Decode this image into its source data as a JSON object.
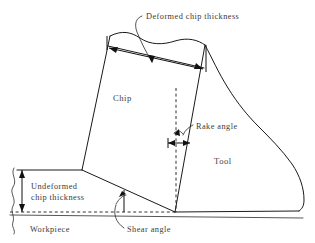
{
  "figure": {
    "kind": "technical-line-diagram",
    "background_color": "#ffffff",
    "line_color": "#1a1a1a",
    "text_color": "#3a3a3a"
  },
  "labels": {
    "deformed_chip_thickness": "Deformed chip thickness",
    "chip": "Chip",
    "rake_angle": "Rake angle",
    "tool": "Tool",
    "undeformed_chip_thickness_line1": "Undeformed",
    "undeformed_chip_thickness_line2": "chip thickness",
    "workpiece": "Workpiece",
    "shear_angle": "Shear angle"
  },
  "annotations": {
    "deformed_chip_thickness_dimension": "double-headed arrow across chip top",
    "undeformed_chip_thickness_dimension": "vertical double-headed arrow at left",
    "rake_angle_dimension": "small horizontal double-headed arrow",
    "shear_angle_arc": "arc between shear plane and workpiece surface",
    "rake_angle_arc": "arc between vertical reference and tool rake face",
    "break_line": "wavy break line at left end of workpiece"
  }
}
